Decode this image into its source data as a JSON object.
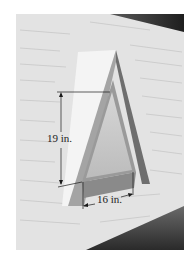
{
  "figure": {
    "height_label": "19 in.",
    "base_label": "16 in.",
    "colors": {
      "siding": "#e2e2e2",
      "siding_line": "#b8b8b8",
      "roof_dark": "#3a3a3a",
      "vent_frame": "#8a8a8a",
      "vent_inner": "#c8c8c8",
      "shadow": "#f2f2f2",
      "dimension_line": "#1a1a1a"
    }
  }
}
